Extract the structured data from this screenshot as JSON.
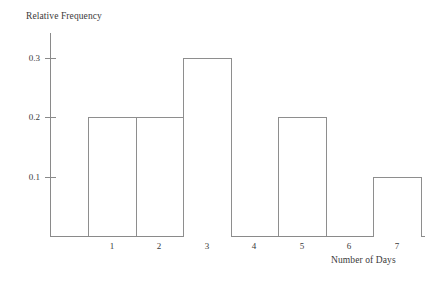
{
  "chart_data": {
    "type": "bar",
    "title": "",
    "subtitle": "",
    "xlabel": "Number of Days",
    "ylabel": "Relative Frequency",
    "categories": [
      "1",
      "2",
      "3",
      "4",
      "5",
      "6",
      "7"
    ],
    "values": [
      0.2,
      0.2,
      0.3,
      0.0,
      0.2,
      0.0,
      0.1
    ],
    "series": [
      {
        "name": "Relative Frequency",
        "values": [
          0.2,
          0.2,
          0.3,
          0.0,
          0.2,
          0.0,
          0.1
        ]
      }
    ],
    "ylim": [
      0,
      0.35
    ],
    "xlim": [
      0.5,
      7.5
    ],
    "y_ticks": [
      0.1,
      0.2,
      0.3
    ],
    "y_tick_labels": [
      "0.1",
      "0.2",
      "0.3"
    ],
    "x_ticks": [
      1,
      2,
      3,
      4,
      5,
      6,
      7
    ],
    "x_tick_labels": [
      "1",
      "2",
      "3",
      "4",
      "5",
      "6",
      "7"
    ],
    "grid": false,
    "legend": false,
    "legend_position": "none",
    "bar_style": "outline",
    "bar_fill_color": "#ffffff",
    "bar_edge_color": "#8e8e8e",
    "axis_color": "#8a8a8a",
    "text_color": "#3a3a3a",
    "background_color": "#ffffff",
    "annotations": []
  },
  "axes": {
    "y_title": "Relative Frequency",
    "x_title": "Number of Days"
  },
  "y_ticks": [
    {
      "label": "0.3",
      "value": 0.3
    },
    {
      "label": "0.2",
      "value": 0.2
    },
    {
      "label": "0.1",
      "value": 0.1
    }
  ],
  "x_ticks": [
    {
      "label": "1",
      "value": 1
    },
    {
      "label": "2",
      "value": 2
    },
    {
      "label": "3",
      "value": 3
    },
    {
      "label": "4",
      "value": 4
    },
    {
      "label": "5",
      "value": 5
    },
    {
      "label": "6",
      "value": 6
    },
    {
      "label": "7",
      "value": 7
    }
  ]
}
